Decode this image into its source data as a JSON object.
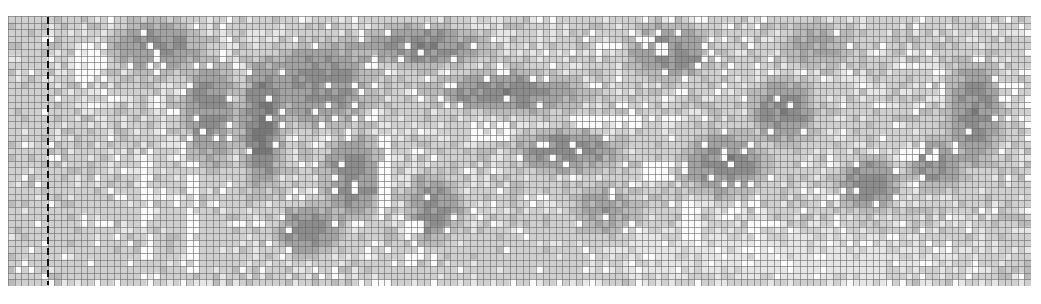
{
  "figure": {
    "kind": "grayscale pixel mosaic chart (cross-stitch style grid)",
    "grid": {
      "cols": 155,
      "rows": 41,
      "line_color": "#6a6a6a",
      "background": "#ffffff"
    },
    "palette": [
      "#fbfbfb",
      "#e6e6e6",
      "#cfcfcf",
      "#b9b9b9",
      "#a2a2a2",
      "#8c8c8c",
      "#777777"
    ],
    "marker": {
      "type": "dashed-vertical-line",
      "column": 6,
      "color": "#111111"
    },
    "base_level": 2,
    "regions": [
      {
        "cx": 3,
        "cy": 20,
        "rx": 4,
        "ry": 24,
        "level": 2
      },
      {
        "cx": 22,
        "cy": 4,
        "rx": 8,
        "ry": 5,
        "level": 5
      },
      {
        "cx": 30,
        "cy": 14,
        "rx": 5,
        "ry": 10,
        "level": 5
      },
      {
        "cx": 38,
        "cy": 16,
        "rx": 4,
        "ry": 12,
        "level": 6
      },
      {
        "cx": 47,
        "cy": 10,
        "rx": 10,
        "ry": 8,
        "level": 5
      },
      {
        "cx": 52,
        "cy": 24,
        "rx": 6,
        "ry": 8,
        "level": 5
      },
      {
        "cx": 45,
        "cy": 32,
        "rx": 6,
        "ry": 5,
        "level": 5
      },
      {
        "cx": 62,
        "cy": 4,
        "rx": 12,
        "ry": 4,
        "level": 5
      },
      {
        "cx": 75,
        "cy": 11,
        "rx": 14,
        "ry": 4,
        "level": 5
      },
      {
        "cx": 64,
        "cy": 29,
        "rx": 5,
        "ry": 7,
        "level": 5
      },
      {
        "cx": 84,
        "cy": 20,
        "rx": 10,
        "ry": 4,
        "level": 5
      },
      {
        "cx": 90,
        "cy": 29,
        "rx": 6,
        "ry": 5,
        "level": 4
      },
      {
        "cx": 100,
        "cy": 5,
        "rx": 8,
        "ry": 5,
        "level": 5
      },
      {
        "cx": 108,
        "cy": 22,
        "rx": 8,
        "ry": 6,
        "level": 5
      },
      {
        "cx": 117,
        "cy": 14,
        "rx": 6,
        "ry": 6,
        "level": 5
      },
      {
        "cx": 122,
        "cy": 4,
        "rx": 6,
        "ry": 4,
        "level": 4
      },
      {
        "cx": 130,
        "cy": 25,
        "rx": 6,
        "ry": 5,
        "level": 5
      },
      {
        "cx": 146,
        "cy": 14,
        "rx": 5,
        "ry": 10,
        "level": 5
      },
      {
        "cx": 140,
        "cy": 22,
        "rx": 5,
        "ry": 5,
        "level": 5
      },
      {
        "cx": 20,
        "cy": 34,
        "rx": 18,
        "ry": 7,
        "level": 2
      },
      {
        "cx": 115,
        "cy": 36,
        "rx": 40,
        "ry": 5,
        "level": 1
      },
      {
        "cx": 75,
        "cy": 36,
        "rx": 20,
        "ry": 5,
        "level": 2
      }
    ],
    "highlights": [
      {
        "x0": 10,
        "y0": 4,
        "x1": 14,
        "y1": 9,
        "level": 0
      },
      {
        "x0": 20,
        "y0": 20,
        "x1": 21,
        "y1": 36,
        "level": 0
      },
      {
        "x0": 27,
        "y0": 22,
        "x1": 28,
        "y1": 38,
        "level": 0
      },
      {
        "x0": 56,
        "y0": 18,
        "x1": 57,
        "y1": 30,
        "level": 0
      },
      {
        "x0": 70,
        "y0": 16,
        "x1": 75,
        "y1": 18,
        "level": 0
      },
      {
        "x0": 85,
        "y0": 15,
        "x1": 95,
        "y1": 16,
        "level": 0
      },
      {
        "x0": 96,
        "y0": 22,
        "x1": 100,
        "y1": 24,
        "level": 0
      },
      {
        "x0": 112,
        "y0": 27,
        "x1": 113,
        "y1": 36,
        "level": 0
      },
      {
        "x0": 135,
        "y0": 20,
        "x1": 140,
        "y1": 21,
        "level": 0
      },
      {
        "x0": 150,
        "y0": 10,
        "x1": 152,
        "y1": 12,
        "level": 0
      },
      {
        "x0": 60,
        "y0": 31,
        "x1": 62,
        "y1": 37,
        "level": 0
      },
      {
        "x0": 102,
        "y0": 28,
        "x1": 104,
        "y1": 33,
        "level": 0
      }
    ]
  }
}
